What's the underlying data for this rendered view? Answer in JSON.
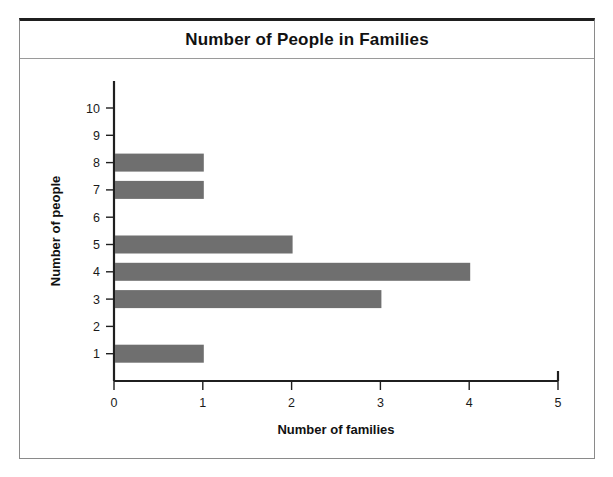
{
  "chart_data": {
    "type": "bar",
    "orientation": "horizontal",
    "title": "Number of People in Families",
    "xlabel": "Number of families",
    "ylabel": "Number of people",
    "categories": [
      1,
      2,
      3,
      4,
      5,
      6,
      7,
      8,
      9,
      10
    ],
    "values": [
      1,
      0,
      3,
      4,
      2,
      0,
      1,
      1,
      0,
      0
    ],
    "xlim": [
      0,
      5
    ],
    "x_ticks": [
      "0",
      "1",
      "2",
      "3",
      "4",
      "5"
    ],
    "y_ticks": [
      "1",
      "2",
      "3",
      "4",
      "5",
      "6",
      "7",
      "8",
      "9",
      "10"
    ],
    "grid": false,
    "legend": null,
    "bar_color": "#6f6f6f",
    "axis_color": "#1f1f1f"
  },
  "frame": {
    "border_color": "#8a8a8a",
    "top_rule_color": "#1f1f1f"
  }
}
